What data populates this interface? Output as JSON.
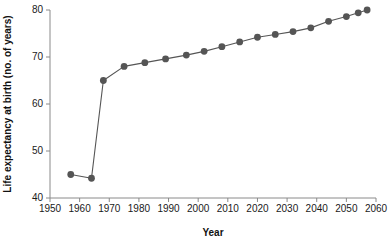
{
  "chart_data": {
    "type": "line",
    "title": "",
    "xlabel": "Year",
    "ylabel": "Life expectancy at birth (no. of years)",
    "xlim": [
      1950,
      2060
    ],
    "ylim": [
      40,
      80
    ],
    "xticks": [
      1950,
      1960,
      1970,
      1980,
      1990,
      2000,
      2010,
      2020,
      2030,
      2040,
      2050,
      2060
    ],
    "yticks": [
      40,
      50,
      60,
      70,
      80
    ],
    "grid": false,
    "legend": null,
    "series": [
      {
        "name": "Life expectancy at birth",
        "color": "#555555",
        "marker": "circle",
        "x": [
          1957,
          1964,
          1968,
          1975,
          1982,
          1989,
          1996,
          2002,
          2008,
          2014,
          2020,
          2026,
          2032,
          2038,
          2044,
          2050,
          2054,
          2057
        ],
        "values": [
          45.0,
          44.2,
          65.0,
          68.0,
          68.8,
          69.6,
          70.4,
          71.2,
          72.2,
          73.2,
          74.2,
          74.8,
          75.4,
          76.2,
          77.6,
          78.6,
          79.4,
          80.0
        ]
      }
    ]
  },
  "footer": {
    "note": ""
  }
}
